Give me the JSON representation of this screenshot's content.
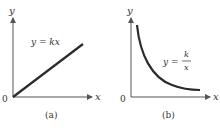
{
  "figure": {
    "panels": [
      {
        "id": "a",
        "caption": "(a)",
        "x_axis_label": "x",
        "y_axis_label": "y",
        "origin_label": "0",
        "equation": "y = kx",
        "curve_type": "linear"
      },
      {
        "id": "b",
        "caption": "(b)",
        "x_axis_label": "x",
        "y_axis_label": "y",
        "origin_label": "0",
        "equation_lhs": "y =",
        "equation_numerator": "k",
        "equation_denominator": "x",
        "curve_type": "inverse"
      }
    ],
    "colors": {
      "axis": "#555555",
      "curve": "#2b2b2b",
      "text": "#333333"
    }
  }
}
